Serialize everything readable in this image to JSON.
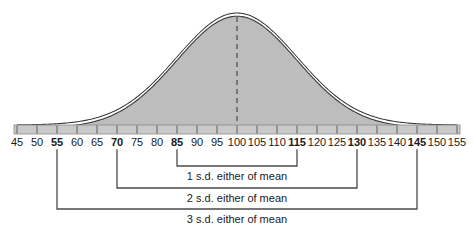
{
  "chart_data": {
    "type": "area",
    "title": "",
    "subtitle": "",
    "xlabel": "",
    "ylabel": "",
    "distribution": "normal",
    "mean": 100,
    "std_dev": 15,
    "xlim": [
      45,
      155
    ],
    "grid": false,
    "legend": null,
    "tick_step": 5,
    "tick_labels": [
      {
        "value": 45,
        "label": "45",
        "bold": false
      },
      {
        "value": 50,
        "label": "50",
        "bold": false
      },
      {
        "value": 55,
        "label": "55",
        "bold": true
      },
      {
        "value": 60,
        "label": "60",
        "bold": false
      },
      {
        "value": 65,
        "label": "65",
        "bold": false
      },
      {
        "value": 70,
        "label": "70",
        "bold": true
      },
      {
        "value": 75,
        "label": "75",
        "bold": false
      },
      {
        "value": 80,
        "label": "80",
        "bold": false
      },
      {
        "value": 85,
        "label": "85",
        "bold": true
      },
      {
        "value": 90,
        "label": "90",
        "bold": false
      },
      {
        "value": 95,
        "label": "95",
        "bold": false
      },
      {
        "value": 100,
        "label": "100",
        "bold": false
      },
      {
        "value": 105,
        "label": "105",
        "bold": false
      },
      {
        "value": 110,
        "label": "110",
        "bold": false
      },
      {
        "value": 115,
        "label": "115",
        "bold": true
      },
      {
        "value": 120,
        "label": "120",
        "bold": false
      },
      {
        "value": 125,
        "label": "125",
        "bold": false
      },
      {
        "value": 130,
        "label": "130",
        "bold": true
      },
      {
        "value": 135,
        "label": "135",
        "bold": false
      },
      {
        "value": 140,
        "label": "140",
        "bold": false
      },
      {
        "value": 145,
        "label": "145",
        "bold": true
      },
      {
        "value": 150,
        "label": "150",
        "bold": false
      },
      {
        "value": 155,
        "label": "155",
        "bold": false
      }
    ],
    "annotations": [
      {
        "id": "sd1",
        "label": "1 s.d. either of mean",
        "from": 85,
        "to": 115
      },
      {
        "id": "sd2",
        "label": "2 s.d. either of mean",
        "from": 70,
        "to": 130
      },
      {
        "id": "sd3",
        "label": "3 s.d. either of mean",
        "from": 55,
        "to": 145
      }
    ],
    "mean_marker": {
      "value": 100,
      "style": "dashed"
    },
    "colors": {
      "curve_fill": "#bdbdbd",
      "curve_outline": "#3a3a3a",
      "axis_band": "#c9c9c9",
      "bracket": "#4a4a4a",
      "text": "#1a1a1a"
    }
  }
}
